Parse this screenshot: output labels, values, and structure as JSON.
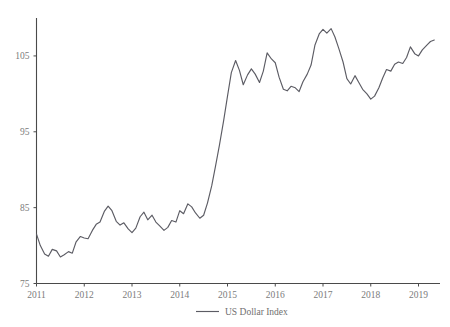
{
  "chart_data": {
    "type": "line",
    "title": "",
    "subtitle": "",
    "xlabel": "",
    "ylabel": "",
    "xlim": [
      2011.0,
      2019.45
    ],
    "ylim": [
      75,
      110
    ],
    "grid": false,
    "legend_position": "bottom-center",
    "y_ticks": [
      75,
      85,
      95,
      105
    ],
    "x_ticks": [
      2011,
      2012,
      2013,
      2014,
      2015,
      2016,
      2017,
      2018,
      2019
    ],
    "y_tick_labels": [
      "75",
      "85",
      "95",
      "105"
    ],
    "x_tick_labels": [
      "2011",
      "2012",
      "2013",
      "2014",
      "2015",
      "2016",
      "2017",
      "2018",
      "2019"
    ],
    "series": [
      {
        "name": "US Dollar Index",
        "color": "#5c5c64",
        "x": [
          2011.0,
          2011.08,
          2011.17,
          2011.25,
          2011.33,
          2011.42,
          2011.5,
          2011.58,
          2011.67,
          2011.75,
          2011.83,
          2011.92,
          2012.0,
          2012.08,
          2012.17,
          2012.25,
          2012.33,
          2012.42,
          2012.5,
          2012.58,
          2012.67,
          2012.75,
          2012.83,
          2012.92,
          2013.0,
          2013.08,
          2013.17,
          2013.25,
          2013.33,
          2013.42,
          2013.5,
          2013.58,
          2013.67,
          2013.75,
          2013.83,
          2013.92,
          2014.0,
          2014.08,
          2014.17,
          2014.25,
          2014.33,
          2014.42,
          2014.5,
          2014.58,
          2014.67,
          2014.75,
          2014.83,
          2014.92,
          2015.0,
          2015.08,
          2015.17,
          2015.25,
          2015.33,
          2015.42,
          2015.5,
          2015.58,
          2015.67,
          2015.75,
          2015.83,
          2015.92,
          2016.0,
          2016.08,
          2016.17,
          2016.25,
          2016.33,
          2016.42,
          2016.5,
          2016.58,
          2016.67,
          2016.75,
          2016.83,
          2016.92,
          2017.0,
          2017.08,
          2017.17,
          2017.25,
          2017.33,
          2017.42,
          2017.5,
          2017.58,
          2017.67,
          2017.75,
          2017.83,
          2017.92,
          2018.0,
          2018.08,
          2018.17,
          2018.25,
          2018.33,
          2018.42,
          2018.5,
          2018.58,
          2018.67,
          2018.75,
          2018.83,
          2018.92,
          2019.0,
          2019.08,
          2019.17,
          2019.25,
          2019.33
        ],
        "values": [
          81.5,
          80.0,
          78.9,
          78.6,
          79.5,
          79.3,
          78.5,
          78.8,
          79.2,
          79.0,
          80.5,
          81.2,
          81.0,
          80.9,
          82.0,
          82.8,
          83.1,
          84.5,
          85.2,
          84.6,
          83.2,
          82.7,
          83.0,
          82.2,
          81.7,
          82.3,
          83.8,
          84.4,
          83.4,
          84.0,
          83.1,
          82.6,
          82.0,
          82.4,
          83.3,
          83.1,
          84.6,
          84.2,
          85.5,
          85.1,
          84.3,
          83.6,
          84.0,
          85.6,
          87.9,
          90.5,
          93.2,
          96.5,
          99.7,
          102.8,
          104.4,
          103.1,
          101.2,
          102.5,
          103.3,
          102.6,
          101.5,
          103.0,
          105.4,
          104.6,
          104.1,
          102.2,
          100.6,
          100.4,
          101.0,
          100.8,
          100.3,
          101.6,
          102.6,
          103.8,
          106.4,
          107.9,
          108.5,
          108.0,
          108.6,
          107.5,
          106.0,
          104.2,
          102.0,
          101.3,
          102.4,
          101.5,
          100.6,
          100.0,
          99.3,
          99.7,
          100.8,
          102.1,
          103.2,
          103.0,
          103.9,
          104.2,
          104.0,
          104.8,
          106.2,
          105.3,
          105.0,
          105.8,
          106.4,
          106.9,
          107.1
        ]
      }
    ],
    "legend": [
      {
        "label": "US Dollar Index",
        "color": "#5c5c64"
      }
    ]
  },
  "legend": {
    "series_label": "US Dollar Index"
  },
  "axes": {
    "y_labels": [
      "105",
      "95",
      "85",
      "75"
    ],
    "x_labels": [
      "2011",
      "2012",
      "2013",
      "2014",
      "2015",
      "2016",
      "2017",
      "2018",
      "2019"
    ]
  }
}
